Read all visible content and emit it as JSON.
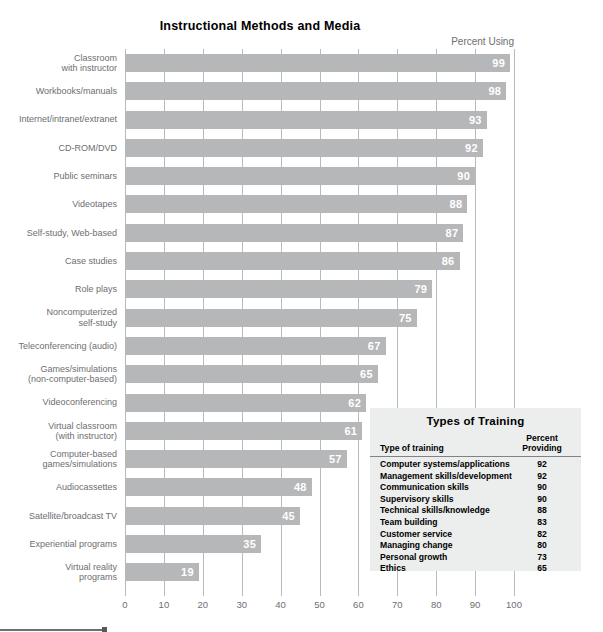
{
  "chart_data": {
    "type": "bar",
    "orientation": "horizontal",
    "title": "Instructional Methods and Media",
    "value_axis_label": "Percent Using",
    "xlabel": "",
    "ylabel": "",
    "xlim": [
      0,
      100
    ],
    "grid": true,
    "xticks": [
      0,
      10,
      20,
      30,
      40,
      50,
      60,
      70,
      80,
      90,
      100
    ],
    "categories": [
      "Classroom\nwith instructor",
      "Workbooks/manuals",
      "Internet/intranet/extranet",
      "CD-ROM/DVD",
      "Public seminars",
      "Videotapes",
      "Self-study, Web-based",
      "Case studies",
      "Role plays",
      "Noncomputerized\nself-study",
      "Teleconferencing (audio)",
      "Games/simulations\n(non-computer-based)",
      "Videoconferencing",
      "Virtual classroom\n(with instructor)",
      "Computer-based\ngames/simulations",
      "Audiocassettes",
      "Satellite/broadcast TV",
      "Experiential programs",
      "Virtual reality\nprograms"
    ],
    "values": [
      99,
      98,
      93,
      92,
      90,
      88,
      87,
      86,
      79,
      75,
      67,
      65,
      62,
      61,
      57,
      48,
      45,
      35,
      19
    ],
    "bar_color": "#b6b7b9",
    "value_label_color": "#ffffff",
    "gridline_color": "#b9babc"
  },
  "inset_table": {
    "title": "Types of Training",
    "columns": [
      "Type of training",
      "Percent\nProviding"
    ],
    "column_name_header": "Type of training",
    "column_value_header_line1": "Percent",
    "column_value_header_line2": "Providing",
    "rows": [
      {
        "name": "Computer systems/applications",
        "value": "92"
      },
      {
        "name": "Management skills/development",
        "value": "92"
      },
      {
        "name": "Communication skills",
        "value": "90"
      },
      {
        "name": "Supervisory skills",
        "value": "90"
      },
      {
        "name": "Technical skills/knowledge",
        "value": "88"
      },
      {
        "name": "Team building",
        "value": "83"
      },
      {
        "name": "Customer service",
        "value": "82"
      },
      {
        "name": "Managing change",
        "value": "80"
      },
      {
        "name": "Personal growth",
        "value": "73"
      },
      {
        "name": "Ethics",
        "value": "65"
      }
    ],
    "background_color": "#eceded"
  }
}
